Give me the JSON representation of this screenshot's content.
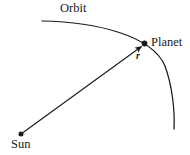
{
  "figure": {
    "background_color": "#ffffff",
    "stroke_color": "#1a1a1a",
    "width": 190,
    "height": 155,
    "labels": {
      "orbit": "Orbit",
      "planet": "Planet",
      "sun": "Sun",
      "radius_vector": "r"
    },
    "elements": {
      "orbit_arc_name": "orbit-arc",
      "radius_arrow_name": "radius-vector-arrow",
      "sun_marker_name": "sun-marker",
      "planet_marker_name": "planet-marker"
    },
    "geometry": {
      "sun_point": [
        21,
        134
      ],
      "planet_point": [
        144,
        44
      ],
      "orbit_arc_start": [
        42,
        21
      ],
      "orbit_arc_end": [
        174,
        129
      ],
      "orbit_arc_control_1": [
        95,
        22
      ],
      "orbit_arc_control_2": [
        170,
        62
      ]
    }
  }
}
